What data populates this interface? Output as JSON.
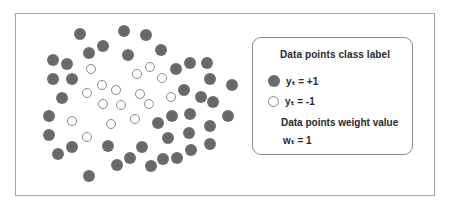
{
  "figure": {
    "colors": {
      "positive_fill": "#6b6b6b",
      "negative_stroke": "#8a8a8a",
      "frame_border": "#a8a8a8",
      "legend_border": "#8c8c8c",
      "text": "#2a2a2a"
    }
  },
  "legend": {
    "class_title": "Data points class label",
    "positive_label": "yₜ = +1",
    "negative_label": "yₜ = -1",
    "weight_title": "Data points weight value",
    "weight_label": "wₜ = 1"
  },
  "points": {
    "positive": [
      [
        80,
        34
      ],
      [
        124,
        31
      ],
      [
        146,
        35
      ],
      [
        103,
        46
      ],
      [
        89,
        53
      ],
      [
        128,
        55
      ],
      [
        161,
        50
      ],
      [
        53,
        60
      ],
      [
        67,
        64
      ],
      [
        176,
        69
      ],
      [
        190,
        63
      ],
      [
        207,
        63
      ],
      [
        53,
        79
      ],
      [
        72,
        79
      ],
      [
        210,
        79
      ],
      [
        232,
        85
      ],
      [
        184,
        90
      ],
      [
        62,
        98
      ],
      [
        201,
        97
      ],
      [
        213,
        102
      ],
      [
        49,
        116
      ],
      [
        158,
        123
      ],
      [
        172,
        116
      ],
      [
        190,
        114
      ],
      [
        228,
        116
      ],
      [
        210,
        126
      ],
      [
        49,
        135
      ],
      [
        168,
        138
      ],
      [
        189,
        133
      ],
      [
        72,
        147
      ],
      [
        58,
        154
      ],
      [
        108,
        146
      ],
      [
        142,
        147
      ],
      [
        210,
        144
      ],
      [
        191,
        150
      ],
      [
        130,
        158
      ],
      [
        117,
        165
      ],
      [
        177,
        158
      ],
      [
        163,
        159
      ],
      [
        151,
        166
      ],
      [
        89,
        176
      ]
    ],
    "negative": [
      [
        91,
        69
      ],
      [
        150,
        67
      ],
      [
        137,
        74
      ],
      [
        162,
        78
      ],
      [
        102,
        85
      ],
      [
        116,
        90
      ],
      [
        87,
        93
      ],
      [
        140,
        94
      ],
      [
        171,
        97
      ],
      [
        103,
        104
      ],
      [
        121,
        105
      ],
      [
        149,
        104
      ],
      [
        72,
        121
      ],
      [
        111,
        124
      ],
      [
        135,
        119
      ],
      [
        87,
        137
      ]
    ]
  }
}
